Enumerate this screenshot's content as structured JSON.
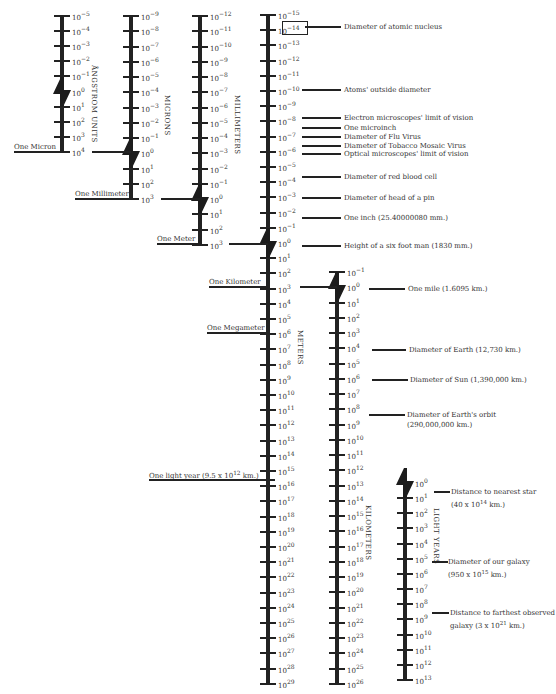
{
  "colors": {
    "ink": "#222222",
    "text": "#333333",
    "background": "#ffffff"
  },
  "axes": [
    {
      "id": "angstrom",
      "unit_label": "ÅNGSTROM UNITS",
      "x": 62,
      "y_start": 16,
      "spacing": 15.1,
      "exp_start": -5,
      "exp_end": 4,
      "break_between": [
        -1,
        1
      ],
      "unit_label_x": 90,
      "unit_label_y": 65
    },
    {
      "id": "microns",
      "unit_label": "MICRONS",
      "x": 131,
      "y_start": 16,
      "spacing": 15.25,
      "exp_start": -9,
      "exp_end": 3,
      "break_between": [
        -1,
        1
      ],
      "unit_label_x": 163,
      "unit_label_y": 95
    },
    {
      "id": "millimeters",
      "unit_label": "MILLIMETERS",
      "x": 200,
      "y_start": 16,
      "spacing": 15.25,
      "exp_start": -12,
      "exp_end": 3,
      "break_between": [
        -1,
        1
      ],
      "unit_label_x": 233,
      "unit_label_y": 95
    },
    {
      "id": "meters",
      "unit_label": "METERS",
      "x": 268,
      "y_start": 15,
      "spacing": 15.2,
      "exp_start": -15,
      "exp_end": 29,
      "break_between": [
        -1,
        1
      ],
      "unit_label_x": 296,
      "unit_label_y": 330
    },
    {
      "id": "kilometers",
      "unit_label": "KILOMETERS",
      "x": 337,
      "y_start": 272,
      "spacing": 15.25,
      "exp_start": -1,
      "exp_end": 26,
      "break_between": [
        -1,
        1
      ],
      "unit_label_x": 364,
      "unit_label_y": 505
    },
    {
      "id": "light_years",
      "unit_label": "LIGHT YEARS",
      "x": 405,
      "y_start": 483,
      "spacing": 15.15,
      "exp_start": 0,
      "exp_end": 13,
      "break_between": [
        0,
        1
      ],
      "unit_label_x": 432,
      "unit_label_y": 508,
      "no_top_tick": true
    }
  ],
  "reference_lines": [
    {
      "label": "One Micron",
      "x1": 14,
      "x2": 62,
      "y": 152,
      "text_x": 14,
      "text_y": 143
    },
    {
      "label": "One Millimeter",
      "x1": 75,
      "x2": 131,
      "y": 199,
      "text_x": 75,
      "text_y": 190
    },
    {
      "label": "One Meter",
      "x1": 157,
      "x2": 200,
      "y": 244,
      "text_x": 157,
      "text_y": 235
    },
    {
      "label": "One Kilometer",
      "x1": 209,
      "x2": 268,
      "y": 287,
      "text_x": 209,
      "text_y": 278
    },
    {
      "label": "One Megameter",
      "x1": 207,
      "x2": 268,
      "y": 333,
      "text_x": 207,
      "text_y": 324
    },
    {
      "label": "One light year (9.5 x 10^12 km.)",
      "x1": 149,
      "x2": 275,
      "y": 480,
      "text_x": 149,
      "text_y": 470
    }
  ],
  "connectors": [
    {
      "x1": 92,
      "x2": 131,
      "y": 152
    },
    {
      "x1": 161,
      "x2": 200,
      "y": 199
    },
    {
      "x1": 229,
      "x2": 268,
      "y": 244
    },
    {
      "x1": 300,
      "x2": 337,
      "y": 287
    }
  ],
  "annotations": [
    {
      "text": "Diameter of atomic nucleus",
      "line_x1": 305,
      "line_x2": 341,
      "y": 27,
      "text_x": 344,
      "text_y": 22
    },
    {
      "text": "Atoms' outside diameter",
      "line_x1": 302,
      "line_x2": 341,
      "y": 90,
      "text_x": 344,
      "text_y": 85
    },
    {
      "text": "Electron microscopes' limit of vision",
      "line_x1": 302,
      "line_x2": 341,
      "y": 118,
      "text_x": 344,
      "text_y": 113
    },
    {
      "text": "One microinch",
      "line_x1": 302,
      "line_x2": 341,
      "y": 128,
      "text_x": 344,
      "text_y": 123
    },
    {
      "text": "Diameter of Flu Virus",
      "line_x1": 302,
      "line_x2": 341,
      "y": 137,
      "text_x": 344,
      "text_y": 132
    },
    {
      "text": "Diameter of Tobacco Mosaic Virus",
      "line_x1": 302,
      "line_x2": 341,
      "y": 146,
      "text_x": 344,
      "text_y": 141
    },
    {
      "text": "Optical microscopes' limit of vision",
      "line_x1": 302,
      "line_x2": 341,
      "y": 154,
      "text_x": 344,
      "text_y": 149
    },
    {
      "text": "Diameter of red blood cell",
      "line_x1": 302,
      "line_x2": 341,
      "y": 177,
      "text_x": 344,
      "text_y": 172
    },
    {
      "text": "Diameter of head of a pin",
      "line_x1": 302,
      "line_x2": 341,
      "y": 198,
      "text_x": 344,
      "text_y": 193
    },
    {
      "text": "One inch (25.40000080 mm.)",
      "line_x1": 302,
      "line_x2": 341,
      "y": 218,
      "text_x": 344,
      "text_y": 213
    },
    {
      "text": "Height of a six foot man (1830 mm.)",
      "line_x1": 302,
      "line_x2": 341,
      "y": 246,
      "text_x": 344,
      "text_y": 241
    },
    {
      "text": "One mile (1.6095 km.)",
      "line_x1": 369,
      "line_x2": 405,
      "y": 289,
      "text_x": 408,
      "text_y": 284
    },
    {
      "text": "Diameter of Earth (12,730 km.)",
      "line_x1": 372,
      "line_x2": 406,
      "y": 350,
      "text_x": 409,
      "text_y": 345
    },
    {
      "text": "Diameter of Sun (1,390,000 km.)",
      "line_x1": 372,
      "line_x2": 408,
      "y": 380,
      "text_x": 410,
      "text_y": 375
    },
    {
      "text": "Diameter of Earth's orbit",
      "text2": "(290,000,000 km.)",
      "line_x1": 369,
      "line_x2": 405,
      "y": 415,
      "text_x": 407,
      "text_y": 410
    },
    {
      "text": "Distance to nearest star",
      "text2": "(40 x 10^14 km.)",
      "line_x1": 434,
      "line_x2": 450,
      "y": 492,
      "text_x": 451,
      "text_y": 487
    },
    {
      "text": "Diameter of our galaxy",
      "text2": "(950 x 10^15 km.)",
      "line_x1": 432,
      "line_x2": 448,
      "y": 562,
      "text_x": 448,
      "text_y": 557
    },
    {
      "text": "Distance to farthest observed",
      "text2": "galaxy (3 x 10^21 km.)",
      "line_x1": 432,
      "line_x2": 449,
      "y": 613,
      "text_x": 450,
      "text_y": 608
    }
  ],
  "nucleus_box": {
    "x": 282,
    "y": 21,
    "width": 24,
    "height": 12
  }
}
